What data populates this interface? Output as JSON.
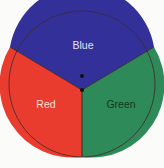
{
  "spinner": {
    "sectors": [
      {
        "label": "Blue",
        "color": "#34309a",
        "text_color": "#e4e4f4"
      },
      {
        "label": "Red",
        "color": "#e93c2e",
        "text_color": "#fde0d8"
      },
      {
        "label": "Green",
        "color": "#2e8a58",
        "text_color": "#123a22"
      }
    ],
    "outline_color": "#3a2a2a"
  }
}
